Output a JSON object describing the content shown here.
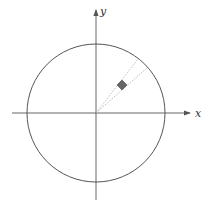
{
  "diagram": {
    "x_label": "x",
    "y_label": "y",
    "colors": {
      "axis": "#555555",
      "circle": "#555555",
      "dotted": "#aaaaaa",
      "square_fill": "#666666",
      "square_stroke": "#444444"
    },
    "circle": {
      "cx": 96,
      "cy": 113,
      "r": 69
    },
    "square": {
      "cx": 122,
      "cy": 85,
      "size": 7,
      "rotation_deg": 45
    }
  }
}
